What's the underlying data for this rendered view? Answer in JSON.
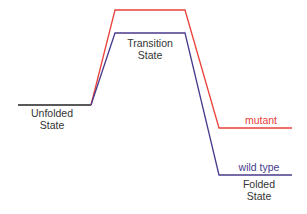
{
  "diagram": {
    "type": "energy-level diagram",
    "colors": {
      "unfolded": "#222222",
      "mutant": "#e8423a",
      "wild_type": "#4a3a8c",
      "text": "#333333"
    },
    "states": {
      "unfolded": {
        "line1": "Unfolded",
        "line2": "State"
      },
      "transition": {
        "line1": "Transition",
        "line2": "State"
      },
      "folded": {
        "line1": "Folded",
        "line2": "State"
      }
    },
    "series": [
      {
        "name": "mutant",
        "label": "mutant",
        "color": "#e8423a",
        "points": [
          [
            91,
            105
          ],
          [
            115,
            10
          ],
          [
            185,
            10
          ],
          [
            219,
            128
          ],
          [
            292,
            128
          ]
        ]
      },
      {
        "name": "wild type",
        "label": "wild type",
        "color": "#4a3a8c",
        "points": [
          [
            91,
            105
          ],
          [
            115,
            33
          ],
          [
            185,
            33
          ],
          [
            219,
            175
          ],
          [
            292,
            175
          ]
        ]
      }
    ],
    "unfolded_line": [
      [
        18,
        105
      ],
      [
        91,
        105
      ]
    ]
  }
}
